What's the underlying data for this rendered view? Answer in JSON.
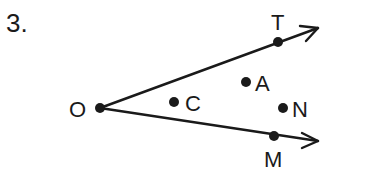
{
  "problem": {
    "number": "3."
  },
  "diagram": {
    "type": "angle-with-rays",
    "colors": {
      "ink": "#1a1a1a",
      "background": "#ffffff"
    },
    "vertex": {
      "label": "O",
      "x": 100,
      "y": 108
    },
    "rays": [
      {
        "name": "ray-OT",
        "from": "O",
        "through": "T",
        "arrow_tip": {
          "x": 318,
          "y": 28
        }
      },
      {
        "name": "ray-OM",
        "from": "O",
        "through": "M",
        "arrow_tip": {
          "x": 318,
          "y": 141
        }
      }
    ],
    "points": [
      {
        "label": "O",
        "x": 100,
        "y": 108,
        "label_x": 70,
        "label_y": 117,
        "location": "vertex"
      },
      {
        "label": "T",
        "x": 278,
        "y": 42,
        "label_x": 272,
        "label_y": 30,
        "location": "on-ray-OT"
      },
      {
        "label": "A",
        "x": 246,
        "y": 82,
        "label_x": 255,
        "label_y": 91,
        "location": "interior"
      },
      {
        "label": "C",
        "x": 174,
        "y": 102,
        "label_x": 185,
        "label_y": 112,
        "location": "interior"
      },
      {
        "label": "N",
        "x": 283,
        "y": 108,
        "label_x": 292,
        "label_y": 117,
        "location": "interior"
      },
      {
        "label": "M",
        "x": 274,
        "y": 136,
        "label_x": 265,
        "label_y": 168,
        "location": "on-ray-OM"
      }
    ]
  }
}
